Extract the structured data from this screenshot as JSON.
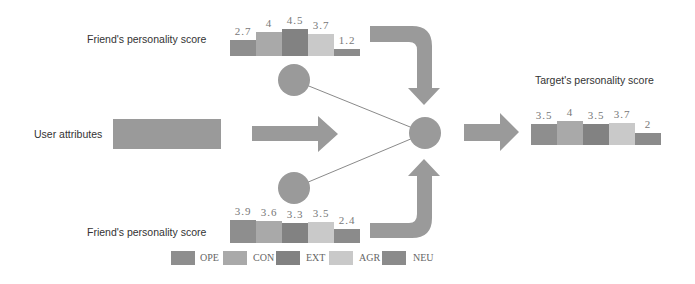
{
  "colors": {
    "OPE": "#8e8e8e",
    "CON": "#a9a9a9",
    "EXT": "#828282",
    "AGR": "#c9c9c9",
    "NEU": "#8b8b8b",
    "shape": "#9a9a9a",
    "line": "#8a8a8a"
  },
  "labels": {
    "friend_top": "Friend's personality score",
    "user_attributes": "User  attributes",
    "friend_bottom": "Friend's personality score",
    "target": "Target's personality score"
  },
  "legend": [
    {
      "key": "OPE",
      "label": "OPE"
    },
    {
      "key": "CON",
      "label": "CON"
    },
    {
      "key": "EXT",
      "label": "EXT"
    },
    {
      "key": "AGR",
      "label": "AGR"
    },
    {
      "key": "NEU",
      "label": "NEU"
    }
  ],
  "chart_data": [
    {
      "type": "bar",
      "title": "Friend's personality score (top)",
      "categories": [
        "OPE",
        "CON",
        "EXT",
        "AGR",
        "NEU"
      ],
      "values": [
        2.7,
        4,
        4.5,
        3.7,
        1.2
      ],
      "value_labels": [
        "2.7",
        "4",
        "4.5",
        "3.7",
        "1.2"
      ]
    },
    {
      "type": "bar",
      "title": "Friend's personality score (bottom)",
      "categories": [
        "OPE",
        "CON",
        "EXT",
        "AGR",
        "NEU"
      ],
      "values": [
        3.9,
        3.6,
        3.3,
        3.5,
        2.4
      ],
      "value_labels": [
        "3.9",
        "3.6",
        "3.3",
        "3.5",
        "2.4"
      ]
    },
    {
      "type": "bar",
      "title": "Target's personality score",
      "categories": [
        "OPE",
        "CON",
        "EXT",
        "AGR",
        "NEU"
      ],
      "values": [
        3.5,
        4,
        3.5,
        3.7,
        2
      ],
      "value_labels": [
        "3.5",
        "4",
        "3.5",
        "3.7",
        "2"
      ]
    }
  ]
}
